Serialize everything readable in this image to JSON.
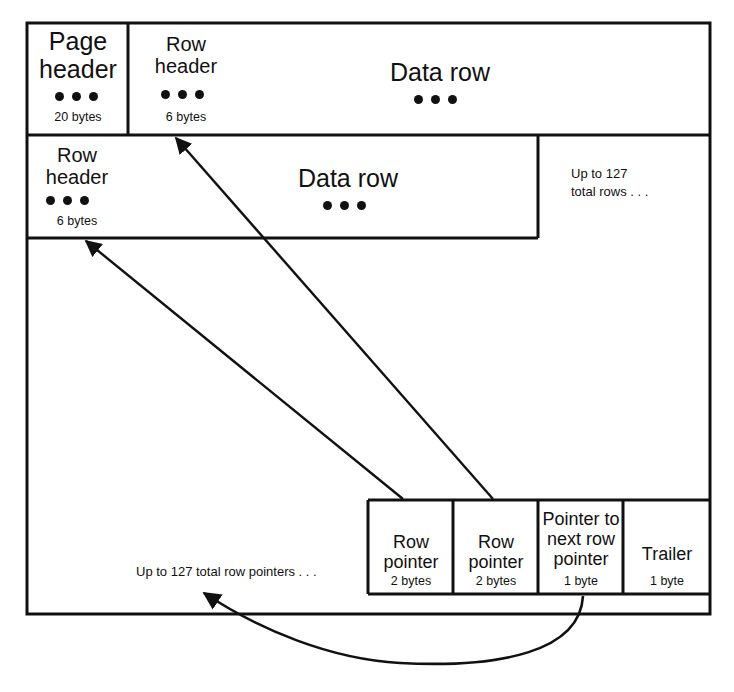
{
  "diagram": {
    "colors": {
      "line": "#111111",
      "fill": "#ffffff",
      "text": "#111111"
    },
    "row1": {
      "page_header": {
        "label": "Page\nheader",
        "size": "20 bytes",
        "ellipsis": "•••"
      },
      "row_header": {
        "label": "Row\nheader",
        "size": "6 bytes",
        "ellipsis": "•••"
      },
      "data_row": {
        "label": "Data row",
        "ellipsis": "•••"
      }
    },
    "row2": {
      "row_header": {
        "label": "Row\nheader",
        "size": "6 bytes",
        "ellipsis": "•••"
      },
      "data_row": {
        "label": "Data row",
        "ellipsis": "•••"
      }
    },
    "notes": {
      "total_rows": "Up to 127\ntotal rows . . .",
      "total_row_pointers": "Up to 127 total row pointers . . ."
    },
    "footer_cells": [
      {
        "label": "Row\npointer",
        "size": "2 bytes"
      },
      {
        "label": "Row\npointer",
        "size": "2 bytes"
      },
      {
        "label": "Pointer to\nnext row\npointer",
        "size": "1 byte"
      },
      {
        "label": "Trailer",
        "size": "1 byte"
      }
    ],
    "connectors": [
      {
        "name": "pointer-to-row2-header-arrow",
        "from": "row-pointer-1",
        "to": "row2-row-header"
      },
      {
        "name": "pointer-to-row1-header-arrow",
        "from": "row-pointer-2",
        "to": "row1-row-header"
      },
      {
        "name": "next-row-pointer-curve-arrow",
        "from": "pointer-to-next-row-pointer",
        "to": "total-row-pointers-note"
      }
    ]
  }
}
